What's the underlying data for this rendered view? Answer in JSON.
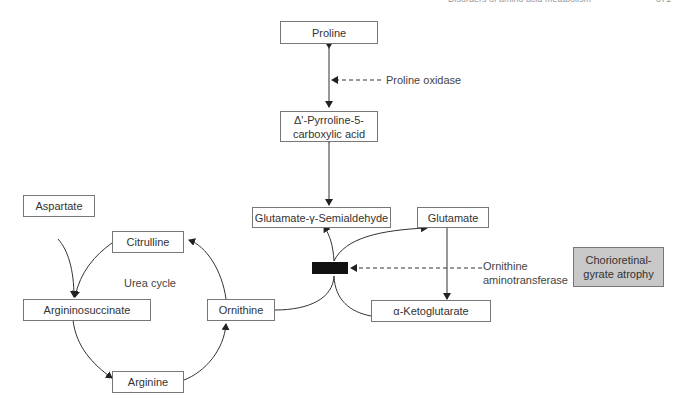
{
  "header": {
    "running_title": "Disorders of amino acid metabolism",
    "page_number": "371"
  },
  "nodes": {
    "proline": "Proline",
    "p5c_line1": "Δ'-Pyrroline-5-",
    "p5c_line2": "carboxylic acid",
    "glutamate_semialdehyde": "Glutamate-γ-Semialdehyde",
    "glutamate": "Glutamate",
    "alpha_ketoglutarate": "α-Ketoglutarate",
    "ornithine": "Ornithine",
    "citrulline": "Citrulline",
    "aspartate": "Aspartate",
    "argininosuccinate": "Argininosuccinate",
    "arginine": "Arginine",
    "disease_line1": "Chorioretinal-",
    "disease_line2": "gyrate atrophy"
  },
  "labels": {
    "proline_oxidase": "Proline oxidase",
    "urea_cycle": "Urea cycle",
    "oat_line1": "Ornithine",
    "oat_line2": "aminotransferase"
  },
  "colors": {
    "line": "#333333",
    "box_border": "#777777",
    "disease_fill": "#c8c8c8",
    "block": "#111111"
  }
}
